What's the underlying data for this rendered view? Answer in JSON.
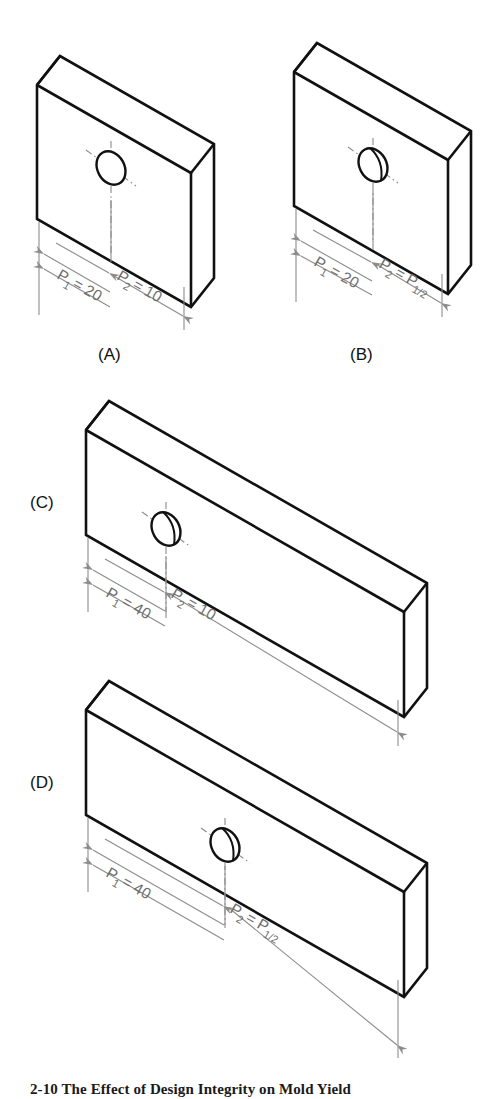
{
  "figure": {
    "caption": "2-10  The Effect of Design Integrity on Mold Yield",
    "caption_visible_note": "clipped at image bottom edge"
  },
  "panels": [
    {
      "id": "A",
      "label": "(A)",
      "block_shape": "short-rectangular-plate",
      "hole": {
        "type": "through-hole",
        "far_wall_visible": false
      },
      "dimensions": [
        {
          "name": "P1",
          "symbol": "P",
          "subscript": "1",
          "equals": "=",
          "value": "20",
          "text": "P 1 = 20"
        },
        {
          "name": "P2",
          "symbol": "P",
          "subscript": "2",
          "equals": "=",
          "value": "10",
          "text": "P 2 = 10"
        }
      ]
    },
    {
      "id": "B",
      "label": "(B)",
      "block_shape": "short-rectangular-plate",
      "hole": {
        "type": "through-hole",
        "far_wall_visible": true
      },
      "dimensions": [
        {
          "name": "P1",
          "symbol": "P",
          "subscript": "1",
          "equals": "=",
          "value": "20",
          "text": "P 1 = 20"
        },
        {
          "name": "P2",
          "symbol": "P",
          "subscript": "2",
          "equals": "=",
          "value": "P 1/2",
          "text": "P 2 = P 1/2"
        }
      ]
    },
    {
      "id": "C",
      "label": "(C)",
      "block_shape": "long-rectangular-plate",
      "hole": {
        "type": "through-hole",
        "far_wall_visible": true
      },
      "dimensions": [
        {
          "name": "P1",
          "symbol": "P",
          "subscript": "1",
          "equals": "=",
          "value": "40",
          "text": "P 1 = 40"
        },
        {
          "name": "P2",
          "symbol": "P",
          "subscript": "2",
          "equals": "=",
          "value": "10",
          "text": "P 2 = 10"
        }
      ]
    },
    {
      "id": "D",
      "label": "(D)",
      "block_shape": "long-rectangular-plate",
      "hole": {
        "type": "through-hole",
        "far_wall_visible": true
      },
      "dimensions": [
        {
          "name": "P1",
          "symbol": "P",
          "subscript": "1",
          "equals": "=",
          "value": "40",
          "text": "P 1 = 40"
        },
        {
          "name": "P2",
          "symbol": "P",
          "subscript": "2",
          "equals": "=",
          "value": "P 1/2",
          "text": "P 2 = P 1/2"
        }
      ]
    }
  ],
  "symbols": {
    "P": "P",
    "sub_1": "1",
    "sub_2": "2",
    "equals": "=",
    "half": "1/2"
  },
  "values": {
    "twenty": "20",
    "ten": "10",
    "forty": "40"
  },
  "colors": {
    "line": "#111111",
    "dimension": "#8c8c8c",
    "dimension_text": "#6f6f6f",
    "background": "#ffffff"
  }
}
